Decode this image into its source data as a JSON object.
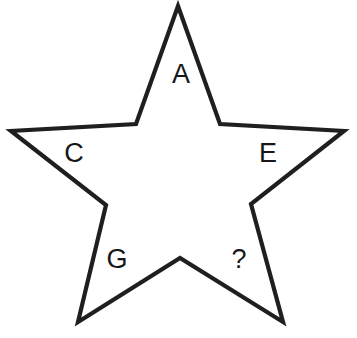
{
  "figure": {
    "kind": "five-pointed-star-diagram",
    "background_color": "#ffffff",
    "stroke_color": "#1f1f1f",
    "stroke_width": 4.2,
    "label_color": "#17171a",
    "label_font_size": 27,
    "canvas": {
      "width": 357,
      "height": 338
    }
  },
  "star": {
    "outline_points": "178,6 220,124 344,131 251,204 283,322 180,258 78,322 106,205 11,131 136,124",
    "vertices": [
      {
        "name": "top-point",
        "type": "outer",
        "x": 178,
        "y": 6
      },
      {
        "name": "upper-right-notch",
        "type": "inner",
        "x": 220,
        "y": 124
      },
      {
        "name": "right-point",
        "type": "outer",
        "x": 344,
        "y": 131
      },
      {
        "name": "right-notch",
        "type": "inner",
        "x": 251,
        "y": 204
      },
      {
        "name": "bottom-right-point",
        "type": "outer",
        "x": 283,
        "y": 322
      },
      {
        "name": "bottom-notch",
        "type": "inner",
        "x": 180,
        "y": 258
      },
      {
        "name": "bottom-left-point",
        "type": "outer",
        "x": 78,
        "y": 322
      },
      {
        "name": "left-notch",
        "type": "inner",
        "x": 106,
        "y": 205
      },
      {
        "name": "left-point",
        "type": "outer",
        "x": 11,
        "y": 131
      },
      {
        "name": "upper-left-notch",
        "type": "inner",
        "x": 136,
        "y": 124
      }
    ]
  },
  "labels": [
    {
      "id": "label-a",
      "text": "A",
      "x": 181,
      "y": 76,
      "arm": "top-point"
    },
    {
      "id": "label-c",
      "text": "C",
      "x": 74,
      "y": 155,
      "arm": "left-point"
    },
    {
      "id": "label-e",
      "text": "E",
      "x": 268,
      "y": 155,
      "arm": "right-point"
    },
    {
      "id": "label-g",
      "text": "G",
      "x": 117,
      "y": 261,
      "arm": "bottom-left-point"
    },
    {
      "id": "label-question",
      "text": "?",
      "x": 239,
      "y": 261,
      "arm": "bottom-right-point"
    }
  ]
}
